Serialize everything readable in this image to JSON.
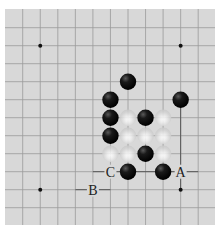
{
  "board": {
    "background": "#d8d8d8",
    "line_color": "#9a9a9a",
    "emphasis_line_color": "#555555",
    "grid": {
      "columns": 11,
      "rows": 11,
      "x0": 22.7,
      "y0": 27.7,
      "dx": 17.55,
      "dy": 18.0
    },
    "star_points": [
      {
        "col": 1,
        "row": 1
      },
      {
        "col": 9,
        "row": 1
      },
      {
        "col": 1,
        "row": 9
      },
      {
        "col": 9,
        "row": 9
      }
    ],
    "emphasized_lines": [
      {
        "from": {
          "col": 9,
          "row": 4
        },
        "to": {
          "col": 9,
          "row": 9
        }
      },
      {
        "from": {
          "col": 4,
          "row": 8
        },
        "to": {
          "col": 10,
          "row": 8
        }
      },
      {
        "from": {
          "col": 3,
          "row": 9
        },
        "to": {
          "col": 5,
          "row": 9
        }
      }
    ]
  },
  "stones": [
    {
      "color": "black",
      "col": 6,
      "row": 3
    },
    {
      "color": "black",
      "col": 5,
      "row": 4
    },
    {
      "color": "black",
      "col": 9,
      "row": 4
    },
    {
      "color": "black",
      "col": 5,
      "row": 5
    },
    {
      "color": "white",
      "col": 6,
      "row": 5
    },
    {
      "color": "black",
      "col": 7,
      "row": 5
    },
    {
      "color": "white",
      "col": 8,
      "row": 5
    },
    {
      "color": "black",
      "col": 5,
      "row": 6
    },
    {
      "color": "white",
      "col": 6,
      "row": 6
    },
    {
      "color": "white",
      "col": 7,
      "row": 6
    },
    {
      "color": "white",
      "col": 8,
      "row": 6
    },
    {
      "color": "white",
      "col": 5,
      "row": 7
    },
    {
      "color": "white",
      "col": 6,
      "row": 7
    },
    {
      "color": "black",
      "col": 7,
      "row": 7
    },
    {
      "color": "white",
      "col": 8,
      "row": 7
    },
    {
      "color": "black",
      "col": 6,
      "row": 8
    },
    {
      "color": "black",
      "col": 8,
      "row": 8
    }
  ],
  "labels": [
    {
      "text": "C",
      "col": 5,
      "row": 8
    },
    {
      "text": "A",
      "col": 9,
      "row": 8
    },
    {
      "text": "B",
      "col": 4,
      "row": 9
    }
  ]
}
